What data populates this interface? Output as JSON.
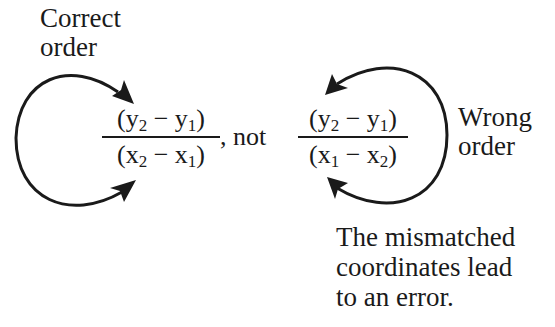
{
  "labels": {
    "correct_line1": "Correct",
    "correct_line2": "order",
    "wrong_line1": "Wrong",
    "wrong_line2": "order",
    "note_line1": "The mismatched",
    "note_line2": "coordinates lead",
    "note_line3": "to an error.",
    "separator": ", not"
  },
  "correct_fraction": {
    "num": {
      "open": "(y",
      "s1": "2",
      "mid": " − y",
      "s2": "1",
      "close": ")"
    },
    "den": {
      "open": "(x",
      "s1": "2",
      "mid": " − x",
      "s2": "1",
      "close": ")"
    }
  },
  "wrong_fraction": {
    "num": {
      "open": "(y",
      "s1": "2",
      "mid": " − y",
      "s2": "1",
      "close": ")"
    },
    "den": {
      "open": "(x",
      "s1": "1",
      "mid": " − x",
      "s2": "2",
      "close": ")"
    }
  },
  "colors": {
    "ink": "#1a1a1a",
    "background": "#ffffff"
  }
}
